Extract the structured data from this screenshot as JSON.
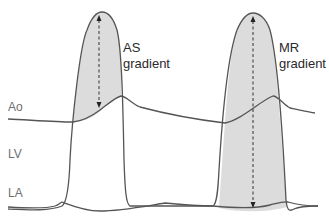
{
  "diagram": {
    "type": "pressure-tracing",
    "traces": [
      {
        "id": "ao",
        "label": "Ao",
        "name": "Aortic pressure"
      },
      {
        "id": "lv",
        "label": "LV",
        "name": "Left ventricular pressure"
      },
      {
        "id": "la",
        "label": "LA",
        "name": "Left atrial pressure"
      }
    ],
    "annotations": [
      {
        "id": "as",
        "line1": "AS",
        "line2": "gradient",
        "meaning": "Gradient between LV peak and aortic pressure"
      },
      {
        "id": "mr",
        "line1": "MR",
        "line2": "gradient",
        "meaning": "Gradient between LV peak and LA pressure"
      }
    ],
    "colors": {
      "curve": "#555555",
      "shaded_fill": "#dcdcdc",
      "label_text": "#6e6e6e",
      "annotation_text": "#2a2a2a",
      "arrow": "#333333"
    }
  }
}
